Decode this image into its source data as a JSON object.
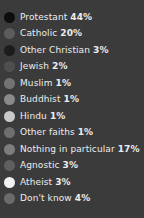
{
  "chart_data": {
    "type": "pie",
    "title": "",
    "subtitle": "",
    "xlabel": "",
    "ylabel": "",
    "legend_position": "left",
    "grid": false,
    "categories": [
      "Protestant",
      "Catholic",
      "Other Christian",
      "Jewish",
      "Muslim",
      "Buddhist",
      "Hindu",
      "Other faiths",
      "Nothing in particular",
      "Agnostic",
      "Atheist",
      "Don't know"
    ],
    "values": [
      44,
      20,
      3,
      2,
      1,
      1,
      1,
      1,
      17,
      3,
      3,
      4
    ],
    "value_labels": [
      "44%",
      "20%",
      "3%",
      "2%",
      "1%",
      "1%",
      "1%",
      "1%",
      "17%",
      "3%",
      "3%",
      "4%"
    ],
    "colors": [
      "#0d0d0d",
      "#5c5c5c",
      "#1c1c1c",
      "#4f4f4f",
      "#737373",
      "#8a8a8a",
      "#c9c9c9",
      "#6e6e6e",
      "#7d7d7d",
      "#5f5f5f",
      "#f2f2f2",
      "#6b6b6b"
    ]
  },
  "legend": {
    "background_color": "#3b3b3b",
    "text_color": "#ededed",
    "items": [
      {
        "label": "Protestant",
        "value": "44%",
        "color": "#0d0d0d"
      },
      {
        "label": "Catholic",
        "value": "20%",
        "color": "#5c5c5c"
      },
      {
        "label": "Other Christian",
        "value": "3%",
        "color": "#1c1c1c"
      },
      {
        "label": "Jewish",
        "value": "2%",
        "color": "#4f4f4f"
      },
      {
        "label": "Muslim",
        "value": "1%",
        "color": "#737373"
      },
      {
        "label": "Buddhist",
        "value": "1%",
        "color": "#8a8a8a"
      },
      {
        "label": "Hindu",
        "value": "1%",
        "color": "#c9c9c9"
      },
      {
        "label": "Other faiths",
        "value": "1%",
        "color": "#6e6e6e"
      },
      {
        "label": "Nothing in particular",
        "value": "17%",
        "color": "#7d7d7d"
      },
      {
        "label": "Agnostic",
        "value": "3%",
        "color": "#5f5f5f"
      },
      {
        "label": "Atheist",
        "value": "3%",
        "color": "#f2f2f2"
      },
      {
        "label": "Don't know",
        "value": "4%",
        "color": "#6b6b6b"
      }
    ]
  }
}
